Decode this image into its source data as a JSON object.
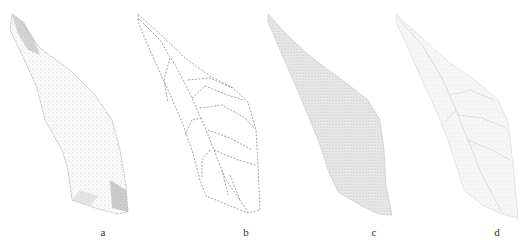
{
  "figure": {
    "panels": [
      {
        "id": "a",
        "label": "a",
        "description": "leaf image, textured with darker base and tip"
      },
      {
        "id": "b",
        "label": "b",
        "description": "leaf outline with vein lines (dotted)"
      },
      {
        "id": "c",
        "label": "c",
        "description": "leaf texture image, dense speckle"
      },
      {
        "id": "d",
        "label": "d",
        "description": "leaf image, light veins"
      }
    ]
  },
  "colors": {
    "background": "#ffffff",
    "ink": "#8a8a8a",
    "dark_ink": "#555555"
  }
}
